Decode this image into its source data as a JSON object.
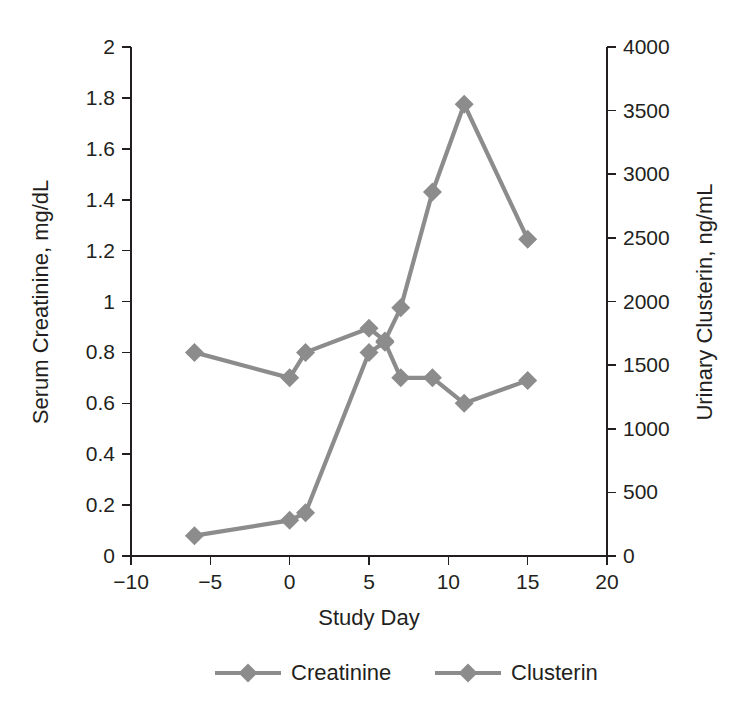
{
  "chart_data": {
    "type": "line",
    "title": "",
    "subtitle": "",
    "xlabel": "Study Day",
    "ylabel": "Serum Creatinine, mg/dL",
    "y2label": "Urinary Clusterin, ng/mL",
    "xlim": [
      -10,
      20
    ],
    "ylim": [
      0,
      2
    ],
    "y2lim": [
      0,
      4000
    ],
    "xticks": [
      "-10",
      "-5",
      "0",
      "5",
      "10",
      "15",
      "20"
    ],
    "xtick_values": [
      -10,
      -5,
      0,
      5,
      10,
      15,
      20
    ],
    "yticks": [
      "0",
      "0.2",
      "0.4",
      "0.6",
      "0.8",
      "1",
      "1.2",
      "1.4",
      "1.6",
      "1.8",
      "2"
    ],
    "ytick_values": [
      0,
      0.2,
      0.4,
      0.6,
      0.8,
      1,
      1.2,
      1.4,
      1.6,
      1.8,
      2
    ],
    "y2ticks": [
      "0",
      "500",
      "1000",
      "1500",
      "2000",
      "2500",
      "3000",
      "3500",
      "4000"
    ],
    "y2tick_values": [
      0,
      500,
      1000,
      1500,
      2000,
      2500,
      3000,
      3500,
      4000
    ],
    "grid": false,
    "legend_position": "bottom",
    "marker": "diamond",
    "series": [
      {
        "name": "Creatinine",
        "axis": "left",
        "color": "#8c8c8c",
        "x": [
          -6,
          0,
          1,
          5,
          6,
          7,
          9,
          11,
          15
        ],
        "values": [
          0.08,
          0.14,
          0.17,
          0.8,
          0.84,
          0.7,
          0.7,
          0.6,
          0.69
        ]
      },
      {
        "name": "Clusterin",
        "axis": "right",
        "color": "#8c8c8c",
        "x": [
          -6,
          0,
          1,
          5,
          6,
          7,
          9,
          11,
          15
        ],
        "values": [
          1600,
          1400,
          1600,
          1790,
          1690,
          1950,
          2860,
          3550,
          2490
        ]
      }
    ],
    "legend": [
      {
        "label": "Creatinine",
        "color": "#8c8c8c"
      },
      {
        "label": "Clusterin",
        "color": "#8c8c8c"
      }
    ]
  },
  "style": {
    "axis_color": "#231f20",
    "series_color": "#8c8c8c",
    "background": "#ffffff"
  }
}
